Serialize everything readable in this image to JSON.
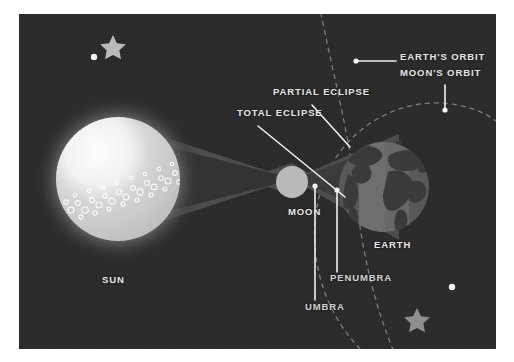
{
  "figure": {
    "background_color": "#2b2b2b",
    "frame_color": "#ffffff",
    "label_color": "#e7e7e7"
  },
  "labels": {
    "sun": "SUN",
    "moon": "MOON",
    "earth": "EARTH",
    "total_eclipse": "TOTAL ECLIPSE",
    "partial_eclipse": "PARTIAL ECLIPSE",
    "earths_orbit": "EARTH'S ORBIT",
    "moons_orbit": "MOON'S ORBIT",
    "penumbra": "PENUMBRA",
    "umbra": "UMBRA"
  },
  "bodies": [
    {
      "name": "sun",
      "label": "SUN",
      "shape": "circle",
      "center": [
        118,
        179
      ],
      "radius": 62,
      "fill": "#c9c9c9",
      "highlight": "#fcfcfc",
      "glow": "#4a4a4a",
      "surface_texture": "granules"
    },
    {
      "name": "moon",
      "label": "MOON",
      "shape": "circle",
      "center": [
        292,
        182
      ],
      "radius": 16,
      "fill": "#b9b9b9"
    },
    {
      "name": "earth",
      "label": "EARTH",
      "shape": "circle",
      "center": [
        384,
        187
      ],
      "radius": 45,
      "ocean_fill": "#585858",
      "land_fill": "#3a3a3a",
      "lit_band_fill": "#6e6e6e"
    }
  ],
  "shadows": [
    {
      "name": "penumbra-cone",
      "label": "PENUMBRA",
      "fill": "#4f4f4f",
      "opacity": 0.9
    },
    {
      "name": "umbra-cone",
      "label": "UMBRA",
      "fill": "#333333",
      "opacity": 1
    }
  ],
  "orbits": [
    {
      "name": "earths-orbit",
      "label": "EARTH'S ORBIT",
      "style": "dashed",
      "color": "#7d7d7d",
      "dash": "4 5"
    },
    {
      "name": "moons-orbit",
      "label": "MOON'S ORBIT",
      "style": "dashed",
      "color": "#7d7d7d",
      "dash": "4 5"
    }
  ],
  "stars": [
    {
      "name": "star-top-left",
      "type": "star5",
      "center": [
        113,
        42
      ],
      "size": 13,
      "fill": "#b9b9b9"
    },
    {
      "name": "dot-top-left",
      "type": "dot",
      "center": [
        94,
        57
      ],
      "size": 3.2,
      "fill": "#f2f2f2"
    },
    {
      "name": "star-bottom-right",
      "type": "star5",
      "center": [
        417,
        317
      ],
      "size": 13,
      "fill": "#8e8e8e"
    },
    {
      "name": "dot-bottom-right",
      "type": "dot",
      "center": [
        452,
        287
      ],
      "size": 3.2,
      "fill": "#f2f2f2"
    }
  ],
  "leaders": [
    {
      "name": "leader-earths-orbit",
      "from": [
        356,
        61
      ],
      "to": [
        396,
        61
      ],
      "dot_at": "from"
    },
    {
      "name": "leader-moons-orbit",
      "from": [
        445,
        85
      ],
      "to": [
        445,
        110
      ],
      "dot_at": "to"
    },
    {
      "name": "leader-partial-eclipse",
      "from": [
        312,
        105
      ],
      "to": [
        350,
        147
      ],
      "dot_at": "none"
    },
    {
      "name": "leader-total-eclipse",
      "from": [
        258,
        126
      ],
      "to": [
        345,
        197
      ],
      "dot_at": "none"
    },
    {
      "name": "leader-penumbra",
      "from": [
        337,
        190
      ],
      "to": [
        337,
        272
      ],
      "dot_at": "from"
    },
    {
      "name": "leader-umbra",
      "from": [
        315,
        186
      ],
      "to": [
        315,
        300
      ],
      "dot_at": "from"
    }
  ]
}
